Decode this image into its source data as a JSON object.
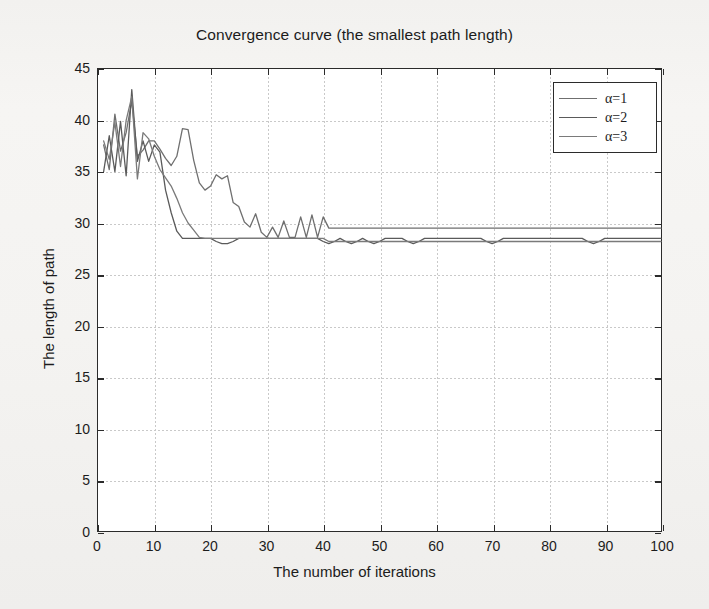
{
  "chart_data": {
    "type": "line",
    "title": "Convergence curve (the smallest path length)",
    "xlabel": "The number of iterations",
    "ylabel": "The length of path",
    "xlim": [
      0,
      100
    ],
    "ylim": [
      0,
      45
    ],
    "xticks": [
      0,
      10,
      20,
      30,
      40,
      50,
      60,
      70,
      80,
      90,
      100
    ],
    "yticks": [
      0,
      5,
      10,
      15,
      20,
      25,
      30,
      35,
      40,
      45
    ],
    "grid": true,
    "legend_position": "upper right",
    "x": [
      1,
      2,
      3,
      4,
      5,
      6,
      7,
      8,
      9,
      10,
      11,
      12,
      13,
      14,
      15,
      16,
      17,
      18,
      19,
      20,
      21,
      22,
      23,
      24,
      25,
      26,
      27,
      28,
      29,
      30,
      31,
      32,
      33,
      34,
      35,
      36,
      37,
      38,
      39,
      40,
      41,
      42,
      43,
      44,
      45,
      46,
      47,
      48,
      49,
      50,
      51,
      52,
      53,
      54,
      55,
      56,
      57,
      58,
      59,
      60,
      61,
      62,
      63,
      64,
      65,
      66,
      67,
      68,
      69,
      70,
      71,
      72,
      73,
      74,
      75,
      76,
      77,
      78,
      79,
      80,
      81,
      82,
      83,
      84,
      85,
      86,
      87,
      88,
      89,
      90,
      91,
      92,
      93,
      94,
      95,
      96,
      97,
      98,
      99,
      100
    ],
    "series": [
      {
        "name": "α=1",
        "color": "#6f6f6f",
        "values": [
          37.6,
          35.2,
          40.6,
          37.0,
          38.8,
          41.9,
          36.5,
          37.1,
          38.0,
          38.0,
          37.2,
          36.3,
          35.6,
          36.5,
          39.2,
          39.1,
          36.1,
          33.9,
          33.2,
          33.6,
          34.7,
          34.3,
          34.6,
          32.0,
          31.6,
          30.1,
          29.6,
          30.9,
          29.1,
          28.6,
          29.6,
          28.6,
          30.2,
          28.6,
          28.6,
          30.6,
          28.6,
          30.8,
          28.6,
          30.6,
          29.5,
          29.5,
          29.5,
          29.5,
          29.5,
          29.5,
          29.5,
          29.5,
          29.5,
          29.5,
          29.5,
          29.5,
          29.5,
          29.5,
          29.5,
          29.5,
          29.5,
          29.5,
          29.5,
          29.5,
          29.5,
          29.5,
          29.5,
          29.5,
          29.5,
          29.5,
          29.5,
          29.5,
          29.5,
          29.5,
          29.5,
          29.5,
          29.5,
          29.5,
          29.5,
          29.5,
          29.5,
          29.5,
          29.5,
          29.5,
          29.5,
          29.5,
          29.5,
          29.5,
          29.5,
          29.5,
          29.5,
          29.5,
          29.5,
          29.5,
          29.5,
          29.5,
          29.5,
          29.5,
          29.5,
          29.5,
          29.5,
          29.5,
          29.5,
          29.5
        ]
      },
      {
        "name": "α=2",
        "color": "#5a5a5a",
        "values": [
          35.0,
          38.5,
          35.0,
          39.9,
          34.6,
          43.0,
          36.0,
          38.0,
          36.0,
          37.6,
          36.9,
          33.2,
          31.0,
          29.2,
          28.5,
          28.5,
          28.5,
          28.5,
          28.5,
          28.5,
          28.2,
          28.0,
          28.0,
          28.2,
          28.5,
          28.5,
          28.5,
          28.5,
          28.5,
          28.5,
          28.5,
          28.5,
          28.5,
          28.5,
          28.5,
          28.5,
          28.5,
          28.5,
          28.5,
          28.2,
          28.0,
          28.2,
          28.5,
          28.2,
          28.0,
          28.2,
          28.5,
          28.2,
          28.0,
          28.2,
          28.5,
          28.5,
          28.5,
          28.5,
          28.2,
          28.0,
          28.2,
          28.5,
          28.5,
          28.5,
          28.5,
          28.5,
          28.5,
          28.5,
          28.5,
          28.5,
          28.5,
          28.5,
          28.2,
          28.0,
          28.2,
          28.5,
          28.5,
          28.5,
          28.5,
          28.5,
          28.5,
          28.5,
          28.5,
          28.5,
          28.5,
          28.5,
          28.5,
          28.5,
          28.5,
          28.5,
          28.2,
          28.0,
          28.2,
          28.5,
          28.5,
          28.5,
          28.5,
          28.5,
          28.5,
          28.5,
          28.5,
          28.5,
          28.5,
          28.5
        ]
      },
      {
        "name": "α=3",
        "color": "#7a7a7a",
        "values": [
          38.0,
          36.2,
          39.8,
          35.5,
          40.0,
          42.3,
          34.3,
          38.8,
          38.2,
          36.5,
          35.2,
          34.4,
          33.6,
          32.4,
          31.0,
          30.0,
          29.3,
          28.6,
          28.5,
          28.5,
          28.5,
          28.5,
          28.5,
          28.5,
          28.5,
          28.5,
          28.5,
          28.5,
          28.5,
          28.5,
          28.5,
          28.5,
          28.5,
          28.5,
          28.5,
          28.5,
          28.5,
          28.5,
          28.5,
          28.5,
          28.2,
          28.2,
          28.2,
          28.2,
          28.2,
          28.2,
          28.2,
          28.2,
          28.2,
          28.2,
          28.2,
          28.2,
          28.2,
          28.2,
          28.2,
          28.2,
          28.2,
          28.2,
          28.2,
          28.2,
          28.2,
          28.2,
          28.2,
          28.2,
          28.2,
          28.2,
          28.2,
          28.2,
          28.2,
          28.2,
          28.2,
          28.2,
          28.2,
          28.2,
          28.2,
          28.2,
          28.2,
          28.2,
          28.2,
          28.2,
          28.2,
          28.2,
          28.2,
          28.2,
          28.2,
          28.2,
          28.2,
          28.2,
          28.2,
          28.2,
          28.2,
          28.2,
          28.2,
          28.2,
          28.2,
          28.2,
          28.2,
          28.2,
          28.2,
          28.2
        ]
      }
    ]
  }
}
